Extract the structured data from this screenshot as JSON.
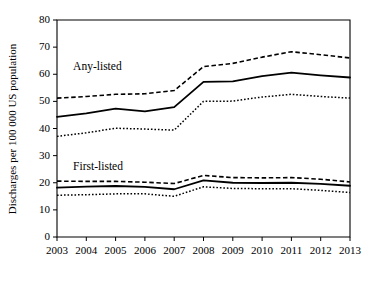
{
  "chart_data": {
    "type": "line",
    "title": "",
    "xlabel": "",
    "ylabel": "Discharges per 100 000 US population",
    "x": [
      2003,
      2004,
      2005,
      2006,
      2007,
      2008,
      2009,
      2010,
      2011,
      2012,
      2013
    ],
    "xtick_labels": [
      "2003",
      "2004",
      "2005",
      "2006",
      "2007",
      "2008",
      "2009",
      "2010",
      "2011",
      "2012",
      "2013"
    ],
    "ytick_labels": [
      "0",
      "10",
      "20",
      "30",
      "40",
      "50",
      "60",
      "70",
      "80"
    ],
    "yticks": [
      0,
      10,
      20,
      30,
      40,
      50,
      60,
      70,
      80
    ],
    "ylim": [
      0,
      80
    ],
    "xlim": [
      2003,
      2013
    ],
    "grid": false,
    "legend_position": "inline-annotation",
    "annotations": [
      {
        "text": "Any-listed",
        "x": 2003.55,
        "y": 61.5
      },
      {
        "text": "First-listed",
        "x": 2003.55,
        "y": 24.8
      }
    ],
    "series": [
      {
        "name": "Any-listed upper CI",
        "group": "Any-listed",
        "style": "dashed",
        "values": [
          51.2,
          51.8,
          52.6,
          52.8,
          54.0,
          62.8,
          64.0,
          66.3,
          68.3,
          67.2,
          66.0
        ]
      },
      {
        "name": "Any-listed estimate",
        "group": "Any-listed",
        "style": "solid",
        "values": [
          44.3,
          45.6,
          47.3,
          46.3,
          47.9,
          57.2,
          57.4,
          59.3,
          60.6,
          59.6,
          58.8
        ]
      },
      {
        "name": "Any-listed lower CI",
        "group": "Any-listed",
        "style": "dotted",
        "values": [
          37.1,
          38.4,
          40.1,
          39.8,
          39.4,
          50.0,
          50.1,
          51.6,
          52.6,
          51.8,
          51.2
        ]
      },
      {
        "name": "First-listed upper CI",
        "group": "First-listed",
        "style": "dashed",
        "values": [
          20.6,
          20.5,
          20.5,
          20.2,
          19.7,
          22.7,
          21.9,
          21.8,
          21.9,
          21.3,
          20.3
        ]
      },
      {
        "name": "First-listed estimate",
        "group": "First-listed",
        "style": "solid",
        "values": [
          18.2,
          18.6,
          18.8,
          18.5,
          17.6,
          20.9,
          20.0,
          19.9,
          20.0,
          19.6,
          18.9
        ]
      },
      {
        "name": "First-listed lower CI",
        "group": "First-listed",
        "style": "dotted",
        "values": [
          15.4,
          15.6,
          15.9,
          15.9,
          15.0,
          18.5,
          17.9,
          17.8,
          17.8,
          17.2,
          16.4
        ]
      }
    ]
  },
  "colors": {
    "line": "#000000",
    "axis": "#000000",
    "background": "#ffffff"
  }
}
